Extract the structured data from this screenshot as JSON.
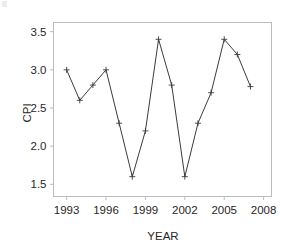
{
  "figure": {
    "background_color": "#ffffff",
    "frame_color": "#b9bcc2",
    "line_color": "#3c3c3c",
    "text_color": "#2a2626"
  },
  "chart_data": {
    "type": "line",
    "title": "",
    "xlabel": "YEAR",
    "ylabel": "CPI",
    "xlim": [
      1992.0,
      2008.6
    ],
    "ylim": [
      1.34,
      3.62
    ],
    "grid": false,
    "legend": null,
    "marker": "plus",
    "xticks": [
      1993,
      1996,
      1999,
      2002,
      2005,
      2008
    ],
    "xtick_labels": [
      "1993",
      "1996",
      "1999",
      "2002",
      "2005",
      "2008"
    ],
    "yticks": [
      1.5,
      2.0,
      2.5,
      3.0,
      3.5
    ],
    "ytick_labels": [
      "1.5",
      "2.0",
      "2.5",
      "3.0",
      "3.5"
    ],
    "x": [
      1993,
      1994,
      1995,
      1996,
      1997,
      1998,
      1999,
      2000,
      2001,
      2002,
      2003,
      2004,
      2005,
      2006,
      2007
    ],
    "values": [
      3.0,
      2.6,
      2.8,
      3.0,
      2.3,
      1.6,
      2.2,
      3.4,
      2.8,
      1.6,
      2.3,
      2.7,
      3.4,
      3.2,
      2.78
    ],
    "series": [
      {
        "name": "CPI",
        "values": [
          3.0,
          2.6,
          2.8,
          3.0,
          2.3,
          1.6,
          2.2,
          3.4,
          2.8,
          1.6,
          2.3,
          2.7,
          3.4,
          3.2,
          2.78
        ]
      }
    ]
  }
}
